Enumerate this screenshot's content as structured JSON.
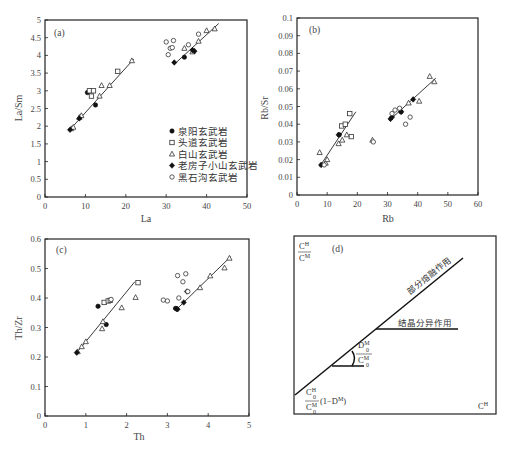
{
  "figure": {
    "legend": [
      {
        "symbol": "filled-circle",
        "label": "泉阳玄武岩"
      },
      {
        "symbol": "open-square",
        "label": "头道玄武岩"
      },
      {
        "symbol": "open-triangle",
        "label": "白山玄武岩"
      },
      {
        "symbol": "filled-diamond",
        "label": "老房子小山玄武岩"
      },
      {
        "symbol": "open-circle",
        "label": "黑石沟玄武岩"
      }
    ],
    "panel_d": {
      "label": "(d)",
      "y_label_num": "C",
      "y_label_num_sup": "H",
      "y_label_den": "C",
      "y_label_den_sup": "M",
      "x_label": "C",
      "x_label_sup": "H",
      "partial_melting": "部分熔融作用",
      "fractional_crystallization": "结晶分异作用",
      "slope_num": "D",
      "slope_num_sub": "0",
      "slope_num_sup": "M",
      "slope_den": "C",
      "slope_den_sub": "0",
      "slope_den_sup": "M",
      "intercept_num": "C",
      "intercept_num_sub": "0",
      "intercept_num_sup": "H",
      "intercept_den": "C",
      "intercept_den_sub": "0",
      "intercept_den_sup": "M",
      "intercept_tail": "(1−D",
      "intercept_tail_sup": "M",
      "intercept_close": ")"
    }
  },
  "chart_data": [
    {
      "type": "scatter",
      "panel": "(a)",
      "title": "",
      "xlabel": "La",
      "ylabel": "La/Sm",
      "xlim": [
        0,
        50
      ],
      "ylim": [
        0,
        5
      ],
      "xticks": [
        "0",
        "10",
        "20",
        "30",
        "40",
        "50"
      ],
      "yticks": [
        "0",
        "0.5",
        "1",
        "1.5",
        "2",
        "2.5",
        "3",
        "3.5",
        "4",
        "4.5",
        "5"
      ],
      "grid": false,
      "legend_position": "lower right",
      "series": [
        {
          "name": "泉阳玄武岩",
          "marker": "filled-circle",
          "points": [
            [
              10.5,
              2.95
            ],
            [
              12.5,
              2.6
            ],
            [
              34.5,
              3.95
            ]
          ]
        },
        {
          "name": "头道玄武岩",
          "marker": "open-square",
          "points": [
            [
              11.0,
              3.0
            ],
            [
              11.5,
              2.85
            ],
            [
              12.0,
              3.0
            ],
            [
              18.0,
              3.55
            ]
          ]
        },
        {
          "name": "白山玄武岩",
          "marker": "open-triangle",
          "points": [
            [
              6.5,
              1.93
            ],
            [
              7.0,
              1.97
            ],
            [
              8.5,
              2.25
            ],
            [
              9.0,
              2.3
            ],
            [
              13.5,
              2.85
            ],
            [
              14.0,
              3.15
            ],
            [
              16.0,
              3.15
            ],
            [
              21.5,
              3.85
            ],
            [
              34.5,
              4.2
            ],
            [
              36.5,
              4.1
            ],
            [
              38.0,
              4.4
            ],
            [
              40.0,
              4.7
            ],
            [
              42.0,
              4.75
            ]
          ]
        },
        {
          "name": "老房子小山玄武岩",
          "marker": "filled-diamond",
          "points": [
            [
              6.2,
              1.9
            ],
            [
              8.5,
              2.22
            ],
            [
              32.0,
              3.8
            ],
            [
              36.5,
              4.15
            ],
            [
              37.0,
              4.12
            ]
          ]
        },
        {
          "name": "黑石沟玄武岩",
          "marker": "open-circle",
          "points": [
            [
              30.0,
              4.38
            ],
            [
              30.5,
              4.02
            ],
            [
              31.0,
              4.2
            ],
            [
              31.5,
              4.22
            ],
            [
              31.8,
              4.42
            ],
            [
              35.5,
              4.3
            ],
            [
              38.0,
              4.6
            ]
          ]
        }
      ],
      "fit_lines": [
        {
          "from": [
            6,
            1.88
          ],
          "to": [
            22,
            3.9
          ]
        },
        {
          "from": [
            32,
            3.75
          ],
          "to": [
            43,
            4.9
          ]
        }
      ]
    },
    {
      "type": "scatter",
      "panel": "(b)",
      "title": "",
      "xlabel": "Rb",
      "ylabel": "Rb/Sr",
      "xlim": [
        0,
        60
      ],
      "ylim": [
        0,
        0.1
      ],
      "xticks": [
        "0",
        "10",
        "20",
        "30",
        "40",
        "50",
        "60"
      ],
      "yticks": [
        "0",
        "0.01",
        "0.02",
        "0.03",
        "0.04",
        "0.05",
        "0.06",
        "0.07",
        "0.08",
        "0.09",
        "0.1"
      ],
      "grid": false,
      "series": [
        {
          "name": "泉阳玄武岩",
          "marker": "filled-circle",
          "points": [
            [
              14.0,
              0.034
            ],
            [
              34.5,
              0.047
            ]
          ]
        },
        {
          "name": "头道玄武岩",
          "marker": "open-square",
          "points": [
            [
              14.8,
              0.039
            ],
            [
              16.0,
              0.04
            ],
            [
              17.5,
              0.046
            ],
            [
              18.0,
              0.033
            ]
          ]
        },
        {
          "name": "白山玄武岩",
          "marker": "open-triangle",
          "points": [
            [
              7.5,
              0.024
            ],
            [
              9.5,
              0.018
            ],
            [
              10.0,
              0.02
            ],
            [
              13.8,
              0.029
            ],
            [
              15.0,
              0.031
            ],
            [
              16.5,
              0.034
            ],
            [
              25.0,
              0.031
            ],
            [
              37.0,
              0.052
            ],
            [
              40.5,
              0.053
            ],
            [
              44.0,
              0.067
            ],
            [
              45.5,
              0.064
            ]
          ]
        },
        {
          "name": "老房子小山玄武岩",
          "marker": "filled-diamond",
          "points": [
            [
              8.0,
              0.017
            ],
            [
              13.8,
              0.034
            ],
            [
              31.0,
              0.043
            ],
            [
              31.5,
              0.044
            ],
            [
              34.5,
              0.047
            ],
            [
              38.5,
              0.054
            ]
          ]
        },
        {
          "name": "黑石沟玄武岩",
          "marker": "open-circle",
          "points": [
            [
              9.0,
              0.017
            ],
            [
              25.3,
              0.03
            ],
            [
              31.5,
              0.046
            ],
            [
              32.5,
              0.048
            ],
            [
              34.0,
              0.049
            ],
            [
              36.0,
              0.04
            ],
            [
              37.5,
              0.044
            ]
          ]
        }
      ],
      "fit_lines": [
        {
          "from": [
            7.5,
            0.016
          ],
          "to": [
            19.5,
            0.047
          ]
        },
        {
          "from": [
            30.5,
            0.042
          ],
          "to": [
            46,
            0.066
          ]
        }
      ]
    },
    {
      "type": "scatter",
      "panel": "(c)",
      "title": "",
      "xlabel": "Th",
      "ylabel": "Th/Zr",
      "xlim": [
        0,
        5
      ],
      "ylim": [
        0,
        0.6
      ],
      "xticks": [
        "0",
        "1",
        "2",
        "3",
        "4",
        "5"
      ],
      "yticks": [
        "0",
        "0.1",
        "0.2",
        "0.3",
        "0.4",
        "0.5",
        "0.6"
      ],
      "grid": false,
      "series": [
        {
          "name": "泉阳玄武岩",
          "marker": "filled-circle",
          "points": [
            [
              1.3,
              0.372
            ],
            [
              1.5,
              0.31
            ],
            [
              3.2,
              0.365
            ]
          ]
        },
        {
          "name": "头道玄武岩",
          "marker": "open-square",
          "points": [
            [
              1.45,
              0.385
            ],
            [
              1.55,
              0.39
            ],
            [
              1.6,
              0.392
            ],
            [
              2.28,
              0.452
            ]
          ]
        },
        {
          "name": "白山玄武岩",
          "marker": "open-triangle",
          "points": [
            [
              0.8,
              0.218
            ],
            [
              0.9,
              0.235
            ],
            [
              1.0,
              0.252
            ],
            [
              1.4,
              0.296
            ],
            [
              1.42,
              0.32
            ],
            [
              1.88,
              0.367
            ],
            [
              2.22,
              0.402
            ],
            [
              3.8,
              0.435
            ],
            [
              4.05,
              0.475
            ],
            [
              4.4,
              0.502
            ],
            [
              4.52,
              0.535
            ]
          ]
        },
        {
          "name": "老房子小山玄武岩",
          "marker": "filled-diamond",
          "points": [
            [
              0.78,
              0.215
            ],
            [
              3.22,
              0.363
            ],
            [
              3.25,
              0.362
            ],
            [
              3.4,
              0.385
            ],
            [
              3.48,
              0.422
            ]
          ]
        },
        {
          "name": "黑石沟玄武岩",
          "marker": "open-circle",
          "points": [
            [
              1.62,
              0.395
            ],
            [
              2.9,
              0.393
            ],
            [
              3.0,
              0.39
            ],
            [
              3.25,
              0.476
            ],
            [
              3.28,
              0.4
            ],
            [
              3.38,
              0.455
            ],
            [
              3.45,
              0.482
            ],
            [
              3.5,
              0.422
            ]
          ]
        }
      ],
      "fit_lines": [
        {
          "from": [
            0.75,
            0.21
          ],
          "to": [
            2.2,
            0.455
          ]
        },
        {
          "from": [
            3.25,
            0.365
          ],
          "to": [
            4.55,
            0.54
          ]
        }
      ]
    },
    {
      "type": "diagram",
      "panel": "(d)",
      "title": "",
      "xlabel": "C^H",
      "ylabel": "C^H/C^M",
      "annotations": [
        "部分熔融作用",
        "结晶分异作用",
        "D0^M/C0^M (slope)",
        "C0^H/C0^M (1−D^M) (intercept)"
      ]
    }
  ]
}
